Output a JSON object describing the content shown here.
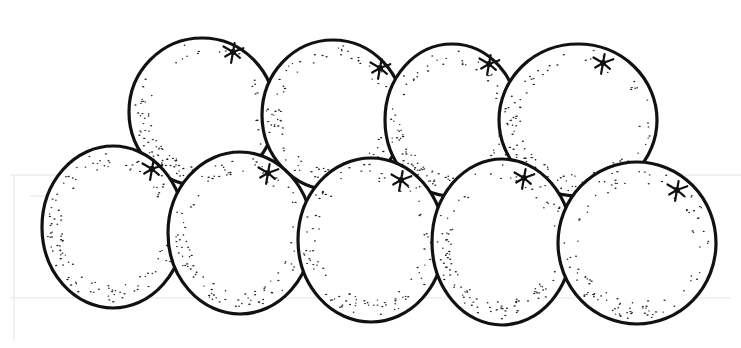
{
  "illustration": {
    "subject": "Nine oranges arranged in two rows",
    "style": "black ink stipple line drawing",
    "colors": {
      "background": "#ffffff",
      "ink": "#111111",
      "bleed": "#e4e4e4"
    },
    "back_row": [
      {
        "id": "orange-back-1",
        "cx": 202,
        "cy": 112,
        "rx": 73,
        "ry": 74,
        "calyx": [
          233,
          52
        ]
      },
      {
        "id": "orange-back-2",
        "cx": 333,
        "cy": 115,
        "rx": 71,
        "ry": 75,
        "calyx": [
          380,
          68
        ]
      },
      {
        "id": "orange-back-3",
        "cx": 452,
        "cy": 120,
        "rx": 67,
        "ry": 76,
        "calyx": [
          489,
          64
        ]
      },
      {
        "id": "orange-back-4",
        "cx": 578,
        "cy": 120,
        "rx": 79,
        "ry": 76,
        "calyx": [
          603,
          63
        ]
      }
    ],
    "front_row": [
      {
        "id": "orange-front-1",
        "cx": 113,
        "cy": 227,
        "rx": 71,
        "ry": 81,
        "calyx": [
          152,
          169
        ]
      },
      {
        "id": "orange-front-2",
        "cx": 240,
        "cy": 233,
        "rx": 72,
        "ry": 81,
        "calyx": [
          268,
          173
        ]
      },
      {
        "id": "orange-front-3",
        "cx": 371,
        "cy": 240,
        "rx": 73,
        "ry": 82,
        "calyx": [
          401,
          180
        ]
      },
      {
        "id": "orange-front-4",
        "cx": 502,
        "cy": 242,
        "rx": 70,
        "ry": 83,
        "calyx": [
          524,
          178
        ]
      },
      {
        "id": "orange-front-5",
        "cx": 637,
        "cy": 243,
        "rx": 79,
        "ry": 81,
        "calyx": [
          677,
          190
        ]
      }
    ]
  }
}
